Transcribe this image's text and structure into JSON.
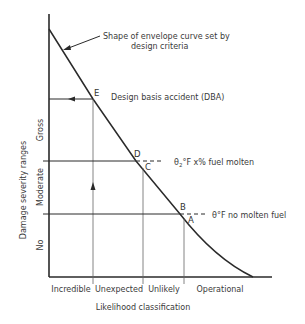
{
  "diagram": {
    "title": "",
    "annotation_curve": {
      "line1": "Shape of envelope curve set by",
      "line2": "design criteria"
    },
    "dba_label": "Design basis accident (DBA)",
    "threshold_d": {
      "label": "θ2°F x% fuel molten",
      "theta": "θ",
      "sub": "2",
      "rest": "°F x% fuel molten"
    },
    "threshold_b": {
      "label": "θ°F no molten fuel"
    },
    "points": {
      "A": "A",
      "B": "B",
      "C": "C",
      "D": "D",
      "E": "E"
    },
    "y_axis": {
      "title": "Damage severity ranges",
      "ranges": [
        "Gross",
        "Moderate",
        "No"
      ]
    },
    "x_axis": {
      "title": "Likelihood classification",
      "categories": [
        "Incredible",
        "Unexpected",
        "Unlikely",
        "Operational"
      ]
    },
    "colors": {
      "line": "#2a2a2a",
      "thin_line": "#555555",
      "text": "#3a3a3a",
      "background": "#ffffff"
    }
  }
}
